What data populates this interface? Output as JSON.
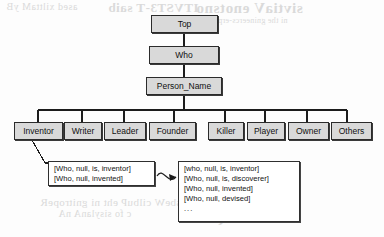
{
  "diagram": {
    "colors": {
      "node_fill": "#d9d9d9",
      "node_border": "#2b2b2b",
      "annotation_fill": "#ffffff",
      "annotation_border": "#2f2f2f",
      "line": "#1c1c1c",
      "background": "#fdfdfd"
    }
  },
  "nodes": {
    "root": {
      "label": "Top"
    },
    "level2": {
      "label": "Who"
    },
    "level3": {
      "label": "Person_Name"
    }
  },
  "leaves": [
    {
      "label": "Inventor"
    },
    {
      "label": "Writer"
    },
    {
      "label": "Leader"
    },
    {
      "label": "Founder"
    },
    {
      "label": "Killer"
    },
    {
      "label": "Player"
    },
    {
      "label": "Owner"
    },
    {
      "label": "Others"
    }
  ],
  "annotations": {
    "left": {
      "lines": [
        "[Who, null, is, inventor]",
        "[Who, null, invented]"
      ]
    },
    "right": {
      "lines": [
        "[who, null, is, inventor]",
        "[Who, null, is, discoverer]",
        "[Who, null, invented]",
        "[Who, null, devised]"
      ],
      "ellipsis": "..."
    }
  },
  "connectors": {
    "arrow_label": "expansion-arrow"
  },
  "ghost_text": {
    "line1": "ased xilttaM yB",
    "line2": "ITVST3-T saib",
    "line3": "sivtiaV  enotsno",
    "line4": "ni the gnineercs-erp eht",
    "line5": "etisbeW cilbuP eht ni gnitropeR",
    "line6": "c fo sisylanA nA",
    "line7": "ZSIUQ"
  }
}
